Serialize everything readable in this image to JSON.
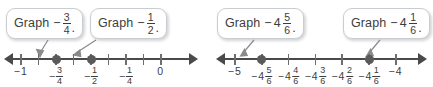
{
  "figure": {
    "type": "number-line-diagram",
    "panels": [
      {
        "id": "left",
        "callouts": [
          {
            "name": "callout-graph-neg-three-fourths",
            "word": "Graph",
            "minus": "−",
            "whole": "",
            "numerator": "3",
            "denominator": "4",
            "period": ".",
            "points_to": "-3/4"
          },
          {
            "name": "callout-graph-neg-one-half",
            "word": "Graph",
            "minus": "−",
            "whole": "",
            "numerator": "1",
            "denominator": "2",
            "period": ".",
            "points_to": "-1/2"
          }
        ],
        "number_line": {
          "min": -1.0,
          "max": 0.0,
          "step": 0.125,
          "ticks": [
            {
              "value": -1.0,
              "minus": "−",
              "whole": "1",
              "numerator": "",
              "denominator": ""
            },
            {
              "value": -0.875,
              "minus": "",
              "whole": "",
              "numerator": "",
              "denominator": ""
            },
            {
              "value": -0.75,
              "minus": "−",
              "whole": "",
              "numerator": "3",
              "denominator": "4"
            },
            {
              "value": -0.625,
              "minus": "",
              "whole": "",
              "numerator": "",
              "denominator": ""
            },
            {
              "value": -0.5,
              "minus": "−",
              "whole": "",
              "numerator": "1",
              "denominator": "2"
            },
            {
              "value": -0.375,
              "minus": "",
              "whole": "",
              "numerator": "",
              "denominator": ""
            },
            {
              "value": -0.25,
              "minus": "−",
              "whole": "",
              "numerator": "1",
              "denominator": "4"
            },
            {
              "value": -0.125,
              "minus": "",
              "whole": "",
              "numerator": "",
              "denominator": ""
            },
            {
              "value": 0.0,
              "minus": "",
              "whole": "0",
              "numerator": "",
              "denominator": ""
            }
          ],
          "plotted_points": [
            -0.75,
            -0.5
          ]
        }
      },
      {
        "id": "right",
        "callouts": [
          {
            "name": "callout-graph-neg-four-and-five-sixths",
            "word": "Graph",
            "minus": "−",
            "whole": "4",
            "numerator": "5",
            "denominator": "6",
            "period": ".",
            "points_to": "-4 5/6"
          },
          {
            "name": "callout-graph-neg-four-and-one-sixth",
            "word": "Graph",
            "minus": "−",
            "whole": "4",
            "numerator": "1",
            "denominator": "6",
            "period": ".",
            "points_to": "-4 1/6"
          }
        ],
        "number_line": {
          "min": -5.0,
          "max": -4.0,
          "step": 0.16666667,
          "ticks": [
            {
              "value": -5.0,
              "minus": "−",
              "whole": "5",
              "numerator": "",
              "denominator": ""
            },
            {
              "value": -4.833333,
              "minus": "−",
              "whole": "4",
              "numerator": "5",
              "denominator": "6"
            },
            {
              "value": -4.666667,
              "minus": "−",
              "whole": "4",
              "numerator": "4",
              "denominator": "6"
            },
            {
              "value": -4.5,
              "minus": "−",
              "whole": "4",
              "numerator": "3",
              "denominator": "6"
            },
            {
              "value": -4.333333,
              "minus": "−",
              "whole": "4",
              "numerator": "2",
              "denominator": "6"
            },
            {
              "value": -4.166667,
              "minus": "−",
              "whole": "4",
              "numerator": "1",
              "denominator": "6"
            },
            {
              "value": -4.0,
              "minus": "−",
              "whole": "4",
              "numerator": "",
              "denominator": ""
            }
          ],
          "plotted_points": [
            -4.833333,
            -4.166667
          ]
        }
      }
    ],
    "colors": {
      "axis": "#4a4a4a",
      "tick": "#6e6e6e",
      "dot": "#5a5a5a",
      "text": "#3d3d3d",
      "bubble_border": "#c9cdd2",
      "bubble_fill": "#ffffff",
      "pointer": "#8a8a8a"
    }
  }
}
